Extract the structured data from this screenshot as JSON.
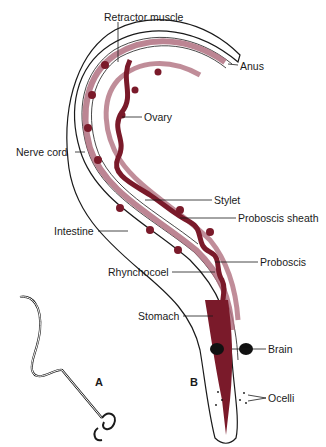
{
  "figure": {
    "panels": [
      {
        "id": "A",
        "label": "A"
      },
      {
        "id": "B",
        "label": "B"
      }
    ]
  },
  "labels": {
    "retractor_muscle": "Retractor muscle",
    "anus": "Anus",
    "ovary": "Ovary",
    "nerve_cord": "Nerve cord",
    "stylet": "Stylet",
    "proboscis_sheath": "Proboscis sheath",
    "intestine": "Intestine",
    "proboscis": "Proboscis",
    "rhynchocoel": "Rhynchocoel",
    "stomach": "Stomach",
    "brain": "Brain",
    "ocelli": "Ocelli"
  },
  "colors": {
    "organ_dark": "#7a1a2a",
    "organ_light": "#b07080",
    "outline": "#1a1a1a",
    "background": "#ffffff"
  }
}
